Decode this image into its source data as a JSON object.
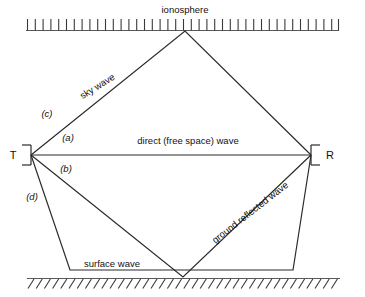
{
  "diagram": {
    "colors": {
      "ray": "#2b2b2b",
      "boundary": "#5a5a5a",
      "hatch": "#3a3a3a",
      "text": "#111111",
      "background": "#ffffff"
    },
    "boundaries": {
      "ionosphere": {
        "label": "ionosphere",
        "hatch_style": "vertical-ticks-above",
        "tick_count": 41
      },
      "ground": {
        "label": "",
        "hatch_style": "diagonal-ticks-below",
        "tick_count": 38
      }
    },
    "nodes": [
      {
        "id": "transmitter",
        "label": "T",
        "bracket": "left"
      },
      {
        "id": "receiver",
        "label": "R",
        "bracket": "right"
      }
    ],
    "path_labels": [
      {
        "id": "sky-wave",
        "text": "sky wave",
        "rotation": -32
      },
      {
        "id": "direct-wave",
        "text": "direct (free space) wave",
        "rotation": 0
      },
      {
        "id": "ground-reflected-wave",
        "text": "ground reflected wave",
        "rotation": -38
      },
      {
        "id": "surface-wave",
        "text": "surface wave",
        "rotation": 0
      }
    ],
    "path_keys": [
      {
        "id": "key-a",
        "text": "(a)",
        "refers_to": "direct (free space) wave"
      },
      {
        "id": "key-b",
        "text": "(b)",
        "refers_to": "ground reflected wave"
      },
      {
        "id": "key-c",
        "text": "(c)",
        "refers_to": "sky wave"
      },
      {
        "id": "key-d",
        "text": "(d)",
        "refers_to": "surface wave"
      }
    ]
  }
}
